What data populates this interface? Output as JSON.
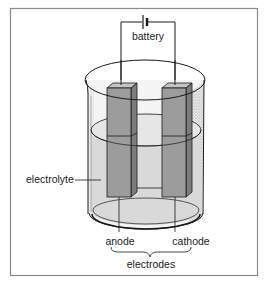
{
  "diagram": {
    "labels": {
      "battery": "battery",
      "electrolyte": "electrolyte",
      "anode": "anode",
      "cathode": "cathode",
      "electrodes": "electrodes"
    },
    "colors": {
      "frame": "#8a8a8a",
      "line": "#1a1a1a",
      "electrode_face": "#9a9a9a",
      "electrode_side": "#7c7c7c",
      "electrode_top": "#c4c4c4",
      "electrolyte": "#d6d6d6",
      "glass": "#f3f3f3",
      "glass_shadow": "#c8c8c8",
      "background": "#ffffff"
    }
  }
}
